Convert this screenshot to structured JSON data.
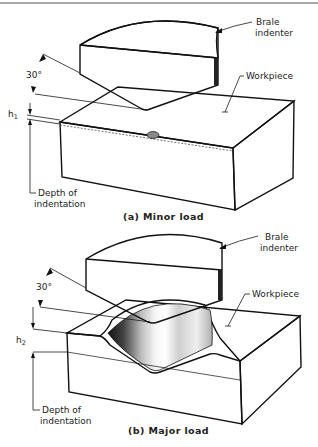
{
  "figure": {
    "panels": [
      {
        "id": "a",
        "caption": "(a) Minor load",
        "labels": {
          "indenter": [
            "Brale",
            "indenter"
          ],
          "workpiece": "Workpiece",
          "angle": "30°",
          "depth_symbol": "h",
          "depth_subscript": "1",
          "depth_label": [
            "Depth of",
            "indentation"
          ]
        }
      },
      {
        "id": "b",
        "caption": "(b) Major load",
        "labels": {
          "indenter": [
            "Brale",
            "indenter"
          ],
          "workpiece": "Workpiece",
          "angle": "30°",
          "depth_symbol": "h",
          "depth_subscript": "2",
          "depth_label": [
            "Depth of",
            "indentation"
          ]
        }
      }
    ]
  },
  "colors": {
    "ink": "#111111",
    "hatch": "#333333",
    "stipple": "#d8d8d8",
    "background": "#ffffff"
  }
}
